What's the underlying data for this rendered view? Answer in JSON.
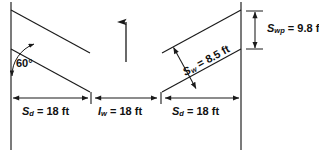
{
  "diagram": {
    "type": "engineering-dimension-diagram",
    "stroke_color": "#1a1a1a",
    "background_color": "#ffffff",
    "angle": {
      "value": "60",
      "unit": "°",
      "text": "60°",
      "description": "stall angle measured from the wall line"
    },
    "dimensions": {
      "stall_depth_left": {
        "symbol": "S",
        "subscript": "d",
        "equals": "=",
        "value": "18",
        "unit": "ft",
        "text": "S_d = 18 ft"
      },
      "aisle_width": {
        "symbol": "I",
        "subscript": "w",
        "equals": "=",
        "value": "18",
        "unit": "ft",
        "text": "I_w = 18 ft"
      },
      "stall_depth_right": {
        "symbol": "S",
        "subscript": "d",
        "equals": "=",
        "value": "18",
        "unit": "ft",
        "text": "S_d = 18 ft"
      },
      "stall_width": {
        "symbol": "S",
        "subscript": "w",
        "equals": "=",
        "value": "8.5",
        "unit": "ft",
        "text": "S_w = 8.5 ft"
      },
      "stall_width_parallel": {
        "symbol": "S",
        "subscript": "wp",
        "equals": "=",
        "value": "9.8",
        "unit": "ft",
        "text": "S_wp = 9.8 ft"
      }
    },
    "flow_arrow": {
      "name": "traffic-flow-arrow",
      "direction": "up"
    }
  }
}
